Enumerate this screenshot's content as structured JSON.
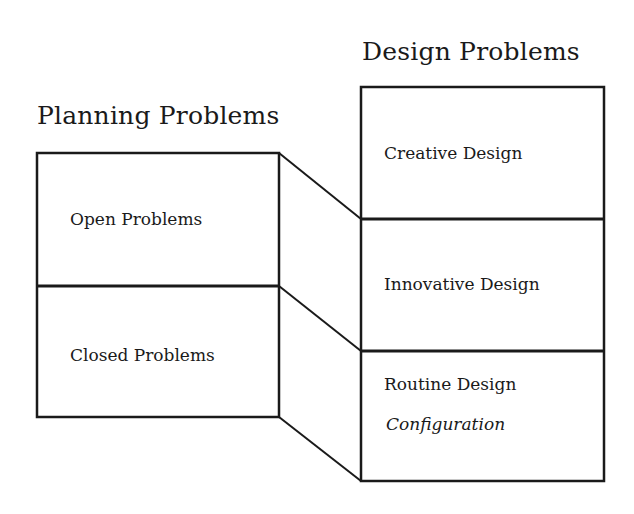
{
  "diagram": {
    "left_column": {
      "title": "Planning Problems",
      "sections": [
        {
          "label": "Open Problems"
        },
        {
          "label": "Closed Problems"
        }
      ]
    },
    "right_column": {
      "title": "Design Problems",
      "sections": [
        {
          "label": "Creative Design"
        },
        {
          "label": "Innovative Design"
        },
        {
          "label": "Routine Design",
          "sublabel": "Configuration"
        }
      ]
    },
    "connections": [
      {
        "from": "Open Problems (top)",
        "to": "Creative Design / Innovative Design boundary"
      },
      {
        "from": "Open Problems / Closed Problems boundary",
        "to": "Innovative Design / Routine Design boundary"
      },
      {
        "from": "Closed Problems (bottom)",
        "to": "Routine Design (bottom)"
      }
    ],
    "colors": {
      "line": "#1a1a1a",
      "background": "#ffffff"
    }
  }
}
